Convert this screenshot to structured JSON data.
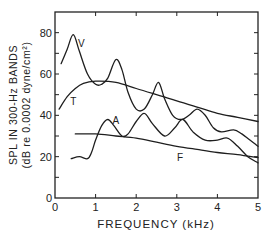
{
  "chart_data": {
    "type": "line",
    "title": "",
    "xlabel": "FREQUENCY (kHz)",
    "ylabel": "SPL IN 300-Hz BANDS",
    "ylabel_sub": "(dB re 0.0002 dyne/cm²)",
    "xlim": [
      0,
      5
    ],
    "ylim": [
      0,
      90
    ],
    "x_ticks": [
      0,
      1,
      2,
      3,
      4,
      5
    ],
    "x_tick_labels": [
      "0",
      "1",
      "2",
      "3",
      "4",
      "5"
    ],
    "y_ticks": [
      0,
      10,
      20,
      30,
      40,
      50,
      60,
      70,
      80
    ],
    "y_tick_labels": [
      "0",
      "",
      "20",
      "",
      "40",
      "",
      "60",
      "",
      "80"
    ],
    "grid": false,
    "legend": "inline labels",
    "series": [
      {
        "name": "V",
        "label_pos": [
          0.65,
          73
        ],
        "x": [
          0.15,
          0.3,
          0.45,
          0.6,
          0.8,
          1.0,
          1.15,
          1.3,
          1.5,
          1.65,
          1.8,
          2.0,
          2.2,
          2.4,
          2.55,
          2.7,
          2.9,
          3.1,
          3.3,
          3.5,
          3.7,
          3.9,
          4.1,
          4.4,
          4.6,
          4.8,
          5.0
        ],
        "values": [
          65,
          72,
          79,
          71,
          60,
          55,
          55,
          58,
          67,
          62,
          51,
          43,
          43,
          50,
          56,
          48,
          40,
          38,
          40,
          43,
          40,
          34,
          32,
          33,
          31,
          28,
          25
        ]
      },
      {
        "name": "T",
        "label_pos": [
          0.45,
          45
        ],
        "x": [
          0.1,
          0.3,
          0.5,
          0.7,
          1.0,
          1.5,
          2.0,
          2.5,
          3.0,
          3.5,
          4.0,
          4.5,
          5.0
        ],
        "values": [
          43,
          49,
          53,
          55.5,
          56.5,
          56,
          53,
          50,
          47,
          44,
          41,
          39,
          37
        ]
      },
      {
        "name": "A",
        "label_pos": [
          1.5,
          36
        ],
        "x": [
          0.4,
          0.6,
          0.8,
          0.9,
          1.0,
          1.15,
          1.3,
          1.45,
          1.65,
          1.8,
          2.0,
          2.2,
          2.4,
          2.7,
          2.95,
          3.15,
          3.4,
          3.7,
          4.0,
          4.25,
          4.5,
          4.75,
          5.0
        ],
        "values": [
          19,
          20,
          19,
          22,
          28,
          35,
          38,
          35,
          30,
          31,
          37,
          41,
          36,
          30,
          34,
          38,
          32,
          28,
          28,
          29,
          25,
          20,
          17
        ]
      },
      {
        "name": "F",
        "label_pos": [
          3.08,
          18
        ],
        "x": [
          0.5,
          1.0,
          1.5,
          2.0,
          2.5,
          3.0,
          3.5,
          4.0,
          4.5,
          5.0
        ],
        "values": [
          31,
          31,
          30,
          29,
          27,
          25,
          23.5,
          22,
          21,
          19.5
        ]
      }
    ]
  },
  "plot": {
    "left": 55,
    "right": 258,
    "top": 12,
    "bottom": 198,
    "line_color": "#1e1e1e"
  }
}
